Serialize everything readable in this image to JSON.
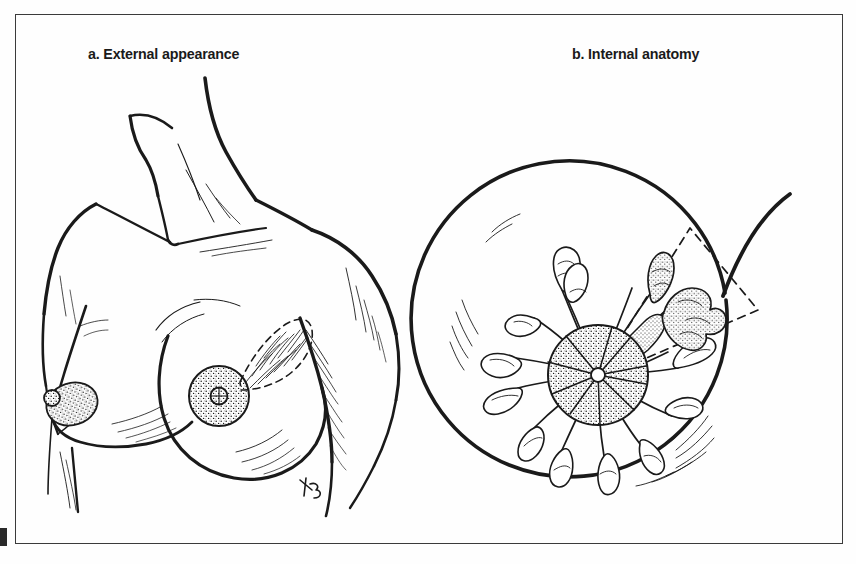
{
  "figure": {
    "domain": "anatomical-line-illustration",
    "background_color": "#fefefe",
    "ink_color": "#1a1a1a",
    "frame": {
      "name": "figure-border",
      "color": "#3b3b3b",
      "style": "thin rectangular rule"
    }
  },
  "panels": [
    {
      "key": "a",
      "title": "a. External appearance",
      "description": "Frontal line drawing of a female torso showing neck, clavicles, shoulders and both breasts",
      "features": [
        "neck and chin contour",
        "clavicle lines",
        "left and right shoulder contours",
        "two breasts in three-quarter view",
        "stippled areola on each breast",
        "dashed wedge over upper-outer quadrant with hatched shading",
        "hatch shading on arm and underarm"
      ],
      "signature": "KB"
    },
    {
      "key": "b",
      "title": "b. Internal anatomy",
      "description": "Cutaway circular view of the breast showing lobules and ducts radiating from the nipple",
      "features": [
        "circular breast outline with upward-sweeping tail",
        "central stippled areola and nipple",
        "ducts radiating outward from nipple",
        "grape-like lobules at the end of each duct",
        "dashed wedge sector marking one quadrant",
        "stippled (shaded) lobules inside the dashed wedge",
        "hatch shading along the inner outline"
      ],
      "lobule_count": 14
    }
  ],
  "labels": {
    "title_a": "a. External appearance",
    "title_b": "b. Internal anatomy"
  }
}
